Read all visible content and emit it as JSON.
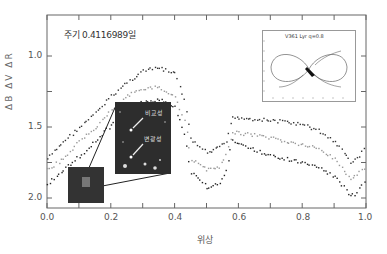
{
  "figure": {
    "period_label": "주기 0.4116989일",
    "x_axis_label": "위상",
    "y_axis_label": "ΔB  ΔV  ΔR",
    "x_ticks": [
      "0.0",
      "0.2",
      "0.4",
      "0.6",
      "0.8",
      "1.0"
    ],
    "y_ticks": [
      "1.0",
      "1.5",
      "2.0"
    ],
    "inset_photo": {
      "comparison_label": "비교성",
      "variable_label": "변광성"
    },
    "roche_inset": {
      "title": "V361 Lyr q=0.8"
    }
  },
  "colors": {
    "frame": "#555555",
    "series_B": "#222222",
    "series_V": "#999999",
    "series_R": "#333333",
    "photo_bg": "#2d2d2d"
  },
  "chart_data": {
    "type": "scatter",
    "title": "주기 0.4116989일",
    "xlabel": "위상",
    "ylabel": "ΔB ΔV ΔR",
    "xlim": [
      0.0,
      1.0
    ],
    "ylim": [
      2.1,
      0.7
    ],
    "y_inverted": true,
    "grid": false,
    "legend": "none",
    "annotations": [
      "주기 0.4116989일",
      "비교성",
      "변광성",
      "V361 Lyr q=0.8"
    ],
    "x": [
      0.0,
      0.05,
      0.1,
      0.15,
      0.2,
      0.25,
      0.3,
      0.35,
      0.4,
      0.43,
      0.45,
      0.5,
      0.54,
      0.56,
      0.58,
      0.6,
      0.65,
      0.7,
      0.75,
      0.8,
      0.85,
      0.9,
      0.93,
      0.95,
      0.97,
      1.0
    ],
    "series": [
      {
        "name": "ΔR (upper)",
        "values": [
          1.72,
          1.6,
          1.5,
          1.4,
          1.28,
          1.18,
          1.1,
          1.08,
          1.12,
          1.3,
          1.58,
          1.68,
          1.64,
          1.6,
          1.42,
          1.43,
          1.44,
          1.45,
          1.46,
          1.48,
          1.52,
          1.6,
          1.68,
          1.74,
          1.72,
          1.62
        ]
      },
      {
        "name": "ΔV (middle, gray)",
        "values": [
          1.8,
          1.72,
          1.6,
          1.5,
          1.38,
          1.28,
          1.22,
          1.22,
          1.28,
          1.45,
          1.72,
          1.8,
          1.78,
          1.7,
          1.53,
          1.54,
          1.55,
          1.57,
          1.6,
          1.62,
          1.65,
          1.72,
          1.8,
          1.86,
          1.84,
          1.76
        ]
      },
      {
        "name": "ΔB (lower)",
        "values": [
          1.9,
          1.8,
          1.7,
          1.6,
          1.48,
          1.38,
          1.32,
          1.3,
          1.36,
          1.55,
          1.82,
          1.92,
          1.9,
          1.8,
          1.58,
          1.62,
          1.66,
          1.7,
          1.72,
          1.75,
          1.78,
          1.85,
          1.92,
          1.98,
          1.96,
          1.86
        ]
      }
    ]
  }
}
